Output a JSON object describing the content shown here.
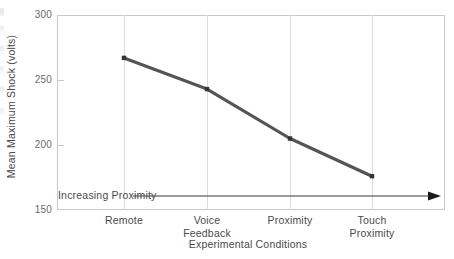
{
  "chart_data": {
    "type": "line",
    "title": "",
    "xlabel": "Experimental Conditions",
    "ylabel": "Mean Maximum Shock (volts)",
    "categories": [
      "Remote",
      "Voice Feedback",
      "Proximity",
      "Touch Proximity"
    ],
    "category_lines": [
      [
        "Remote",
        ""
      ],
      [
        "Voice",
        "Feedback"
      ],
      [
        "Proximity",
        ""
      ],
      [
        "Touch",
        "Proximity"
      ]
    ],
    "values": [
      267,
      243,
      205,
      176
    ],
    "series": [
      {
        "name": "Mean Maximum Shock",
        "values": [
          267,
          243,
          205,
          176
        ]
      }
    ],
    "ylim": [
      150,
      300
    ],
    "yticks": [
      300,
      250,
      200,
      150
    ],
    "ytick_labels": [
      "300",
      "250",
      "200",
      "150"
    ],
    "grid": "vertical-category-lines",
    "legend": "none",
    "annotations": [
      {
        "text": "Increasing Proximity",
        "type": "arrow-right",
        "position": "below-series-inside-plot"
      }
    ],
    "colors": {
      "line": "#555555",
      "marker": "#333333",
      "frame": "#c8c8c8",
      "gridline": "#dcdcdc",
      "tick_label": "#6a6a6a",
      "axis_title": "#4a4a4a",
      "annotation": "#4a4a4a",
      "background": "#ffffff"
    }
  }
}
